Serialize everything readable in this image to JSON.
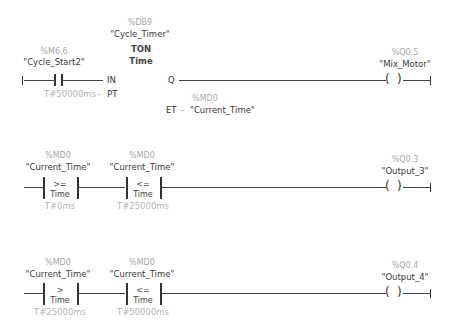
{
  "network1": {
    "contact": {
      "address": "%M6.6",
      "symbol": "\"Cycle_Start2\""
    },
    "timer": {
      "address": "%DB9",
      "symbol": "\"Cycle_Timer\"",
      "type": "TON",
      "data_type": "Time",
      "pin_in": "IN",
      "pin_pt": "PT",
      "pin_q": "Q",
      "pin_et": "ET",
      "pt_value": "T#50000ms",
      "et_address": "%MD0",
      "et_symbol": "\"Current_Time\""
    },
    "coil": {
      "address": "%Q0.5",
      "symbol": "\"Mix_Motor\""
    }
  },
  "network2": {
    "compare1": {
      "address": "%MD0",
      "symbol": "\"Current_Time\"",
      "operator": ">=",
      "data_type": "Time",
      "value": "T#0ms"
    },
    "compare2": {
      "address": "%MD0",
      "symbol": "\"Current_Time\"",
      "operator": "<=",
      "data_type": "Time",
      "value": "T#25000ms"
    },
    "coil": {
      "address": "%Q0.3",
      "symbol": "\"Output_3\""
    }
  },
  "network3": {
    "compare1": {
      "address": "%MD0",
      "symbol": "\"Current_Time\"",
      "operator": ">",
      "data_type": "Time",
      "value": "T#25000ms"
    },
    "compare2": {
      "address": "%MD0",
      "symbol": "\"Current_Time\"",
      "operator": "<=",
      "data_type": "Time",
      "value": "T#50000ms"
    },
    "coil": {
      "address": "%Q0.4",
      "symbol": "\"Output_4\""
    }
  },
  "glyphs": {
    "coil_left": "(",
    "coil_right": ")",
    "pt_dash": "–",
    "et_dash": "–"
  }
}
